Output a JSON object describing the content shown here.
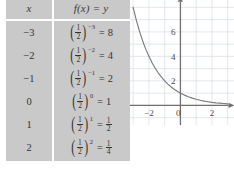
{
  "table": {
    "headers": {
      "x": "x",
      "fx": "f(x) = y"
    },
    "base_numerator": "1",
    "base_denominator": "2",
    "equals_sign": "=",
    "left_paren": "(",
    "right_paren": ")",
    "rows": [
      {
        "x": "−3",
        "exponent": "−3",
        "result": "8",
        "result_is_fraction": false,
        "result_num": "",
        "result_den": ""
      },
      {
        "x": "−2",
        "exponent": "−2",
        "result": "4",
        "result_is_fraction": false,
        "result_num": "",
        "result_den": ""
      },
      {
        "x": "−1",
        "exponent": "−1",
        "result": "2",
        "result_is_fraction": false,
        "result_num": "",
        "result_den": ""
      },
      {
        "x": "0",
        "exponent": "0",
        "result": "1",
        "result_is_fraction": false,
        "result_num": "",
        "result_den": ""
      },
      {
        "x": "1",
        "exponent": "1",
        "result": "",
        "result_is_fraction": true,
        "result_num": "1",
        "result_den": "2"
      },
      {
        "x": "2",
        "exponent": "2",
        "result": "",
        "result_is_fraction": true,
        "result_num": "1",
        "result_den": "4"
      }
    ]
  },
  "chart_data": {
    "type": "line",
    "title": "",
    "xlabel": "x",
    "ylabel": "y",
    "xlim": [
      -3.2,
      3.4
    ],
    "ylim": [
      -1.6,
      8.6
    ],
    "grid": true,
    "grid_color": "#d6dde6",
    "axis_color": "#6f6f6f",
    "curve_color": "#7a7a7a",
    "x_ticks": [
      {
        "value": -2,
        "label": "−2"
      },
      {
        "value": 0,
        "label": "0"
      },
      {
        "value": 2,
        "label": "2"
      }
    ],
    "y_ticks": [
      {
        "value": 2,
        "label": "2"
      },
      {
        "value": 4,
        "label": "4"
      },
      {
        "value": 6,
        "label": "6"
      }
    ],
    "series": [
      {
        "name": "f(x) = (1/2)^x",
        "x": [
          -3,
          -2.8,
          -2.6,
          -2.4,
          -2.2,
          -2,
          -1.8,
          -1.6,
          -1.4,
          -1.2,
          -1,
          -0.8,
          -0.6,
          -0.4,
          -0.2,
          0,
          0.25,
          0.5,
          0.75,
          1,
          1.25,
          1.5,
          1.75,
          2,
          2.25,
          2.5,
          2.75,
          3
        ],
        "y": [
          8,
          6.96,
          6.06,
          5.28,
          4.59,
          4,
          3.48,
          3.03,
          2.64,
          2.3,
          2,
          1.74,
          1.52,
          1.32,
          1.15,
          1,
          0.84,
          0.71,
          0.59,
          0.5,
          0.42,
          0.35,
          0.3,
          0.25,
          0.21,
          0.18,
          0.15,
          0.125
        ]
      }
    ]
  }
}
